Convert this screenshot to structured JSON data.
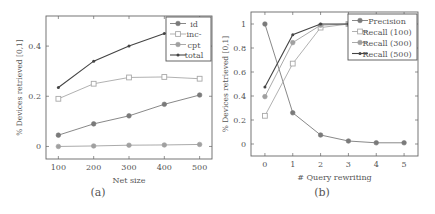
{
  "chart_data": [
    {
      "id": "a",
      "type": "line",
      "caption": "(a)",
      "title": "",
      "xlabel": "Net size",
      "ylabel": "% Devices retrieved [0,1]",
      "x": [
        100,
        200,
        300,
        400,
        500
      ],
      "x_ticks": [
        "100",
        "200",
        "300",
        "400",
        "500"
      ],
      "y_ticks": [
        "0",
        "0.2",
        "0.4"
      ],
      "y_tick_values": [
        0,
        0.2,
        0.4
      ],
      "xlim": [
        65,
        535
      ],
      "ylim": [
        -0.05,
        0.52
      ],
      "grid": false,
      "legend_position": "upper right",
      "series": [
        {
          "name": "id",
          "marker": "circle",
          "color": "#7a7a7a",
          "values": [
            0.045,
            0.09,
            0.122,
            0.168,
            0.205
          ]
        },
        {
          "name": "inc-",
          "marker": "square-open",
          "color": "#a8a8a8",
          "values": [
            0.19,
            0.25,
            0.275,
            0.277,
            0.27
          ]
        },
        {
          "name": "cpt",
          "marker": "circle",
          "color": "#a0a0a0",
          "values": [
            0.0,
            0.002,
            0.005,
            0.006,
            0.008
          ]
        },
        {
          "name": "total",
          "marker": "star",
          "color": "#444444",
          "values": [
            0.235,
            0.34,
            0.4,
            0.45,
            0.47
          ]
        }
      ]
    },
    {
      "id": "b",
      "type": "line",
      "caption": "(b)",
      "title": "",
      "xlabel": "# Query rewriting",
      "ylabel": "% Devices retrieved [0,1]",
      "x": [
        0,
        1,
        2,
        3,
        4,
        5
      ],
      "x_ticks": [
        "0",
        "1",
        "2",
        "3",
        "4",
        "5"
      ],
      "y_ticks": [
        "0",
        "0.2",
        "0.4",
        "0.6",
        "0.8",
        "1"
      ],
      "y_tick_values": [
        0,
        0.2,
        0.4,
        0.6,
        0.8,
        1.0
      ],
      "xlim": [
        -0.5,
        5.5
      ],
      "ylim": [
        -0.1,
        1.1
      ],
      "grid": false,
      "legend_position": "upper right",
      "series": [
        {
          "name": "Precision",
          "marker": "circle",
          "color": "#7a7a7a",
          "values": [
            1.0,
            0.26,
            0.075,
            0.025,
            0.01,
            0.01
          ]
        },
        {
          "name": "Recall (100)",
          "marker": "square-open",
          "color": "#a8a8a8",
          "values": [
            0.235,
            0.67,
            0.97,
            1.0,
            1.0,
            1.0
          ]
        },
        {
          "name": "Recall (300)",
          "marker": "circle",
          "color": "#a0a0a0",
          "values": [
            0.395,
            0.845,
            0.99,
            1.0,
            1.0,
            1.0
          ]
        },
        {
          "name": "Recall (500)",
          "marker": "star",
          "color": "#444444",
          "values": [
            0.475,
            0.91,
            1.0,
            1.0,
            1.0,
            1.0
          ]
        }
      ]
    }
  ]
}
